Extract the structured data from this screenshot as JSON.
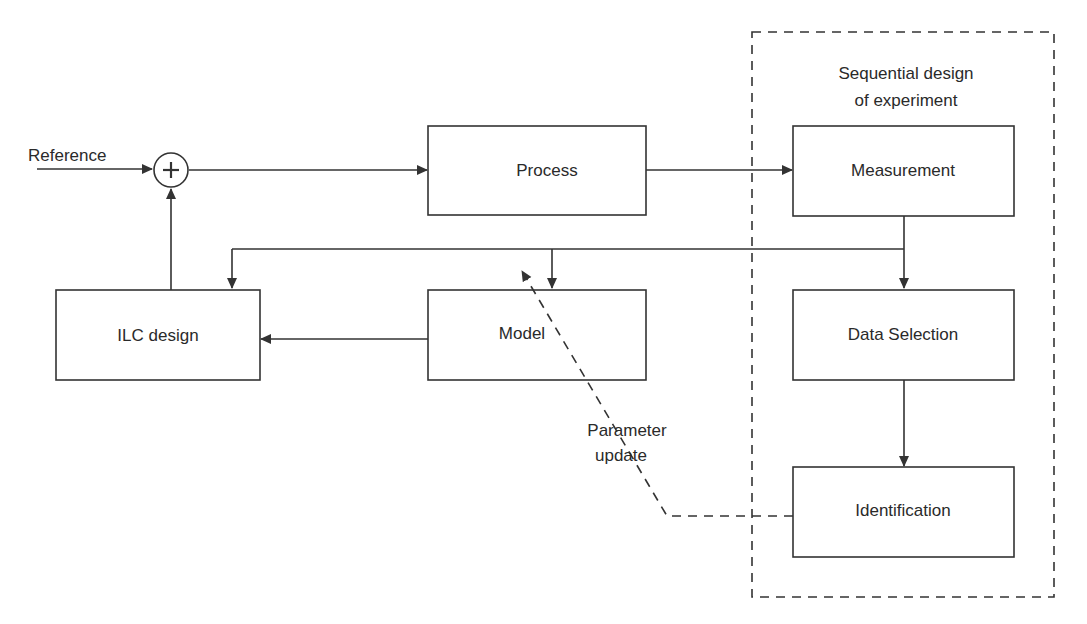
{
  "diagram": {
    "group": {
      "label_line1": "Sequential design",
      "label_line2": "of experiment"
    },
    "inputs": {
      "reference": "Reference",
      "summing_junction": "+"
    },
    "blocks": {
      "process": "Process",
      "measurement": "Measurement",
      "ilc_design": "ILC design",
      "model": "Model",
      "data_selection": "Data Selection",
      "identification": "Identification"
    },
    "annotations": {
      "parameter_update_line1": "Parameter",
      "parameter_update_line2": "update"
    },
    "edges": [
      {
        "from": "Reference",
        "to": "summing_junction"
      },
      {
        "from": "summing_junction",
        "to": "Process"
      },
      {
        "from": "Process",
        "to": "Measurement"
      },
      {
        "from": "Measurement",
        "to": "Data Selection"
      },
      {
        "from": "Measurement",
        "to": "Model"
      },
      {
        "from": "Measurement",
        "to": "ILC design"
      },
      {
        "from": "Data Selection",
        "to": "Identification"
      },
      {
        "from": "Model",
        "to": "ILC design"
      },
      {
        "from": "ILC design",
        "to": "summing_junction"
      },
      {
        "from": "Identification",
        "to": "Model",
        "style": "dashed",
        "label": "Parameter update"
      }
    ],
    "colors": {
      "stroke": "#333333",
      "text": "#2a2a2a",
      "background": "#ffffff"
    }
  }
}
